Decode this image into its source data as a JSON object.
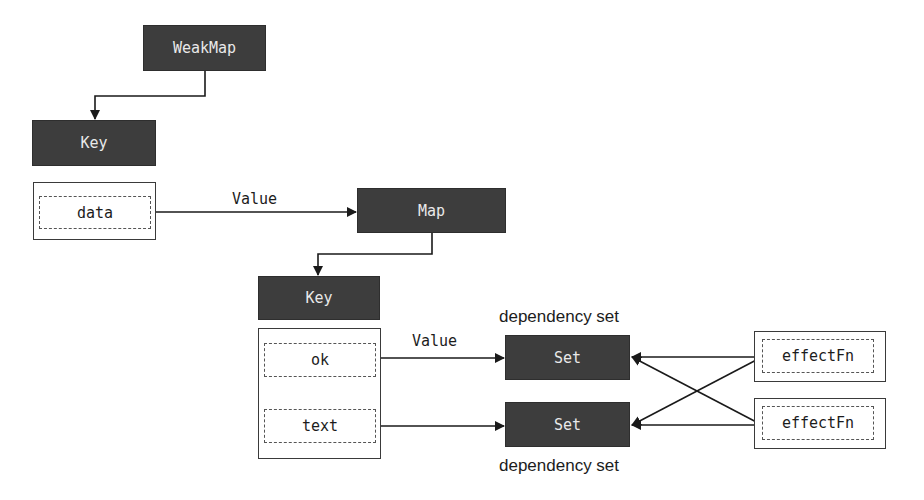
{
  "diagram": {
    "type": "reactive-dependency-structure",
    "colors": {
      "node_fill": "#3d3d3d",
      "node_text": "#e9e9e9",
      "line": "#1a1a1a",
      "background": "#ffffff"
    },
    "nodes": {
      "weakmap": {
        "label": "WeakMap"
      },
      "key_top": {
        "label": "Key"
      },
      "data": {
        "label": "data"
      },
      "map": {
        "label": "Map"
      },
      "key_bottom": {
        "label": "Key"
      },
      "ok": {
        "label": "ok"
      },
      "text": {
        "label": "text"
      },
      "set_top": {
        "label": "Set"
      },
      "set_bottom": {
        "label": "Set"
      },
      "effect_top": {
        "label": "effectFn"
      },
      "effect_bottom": {
        "label": "effectFn"
      }
    },
    "edge_labels": {
      "data_to_map": "Value",
      "ok_to_set": "Value"
    },
    "annotations": {
      "set_top_caption": "dependency set",
      "set_bottom_caption": "dependency set"
    },
    "edges": [
      {
        "from": "WeakMap",
        "to": "Key"
      },
      {
        "from": "data",
        "to": "Map",
        "label": "Value"
      },
      {
        "from": "Map",
        "to": "Key"
      },
      {
        "from": "ok",
        "to": "Set (top)",
        "label": "Value"
      },
      {
        "from": "text",
        "to": "Set (bottom)"
      },
      {
        "from": "effectFn (top)",
        "to": "Set (top)"
      },
      {
        "from": "effectFn (top)",
        "to": "Set (bottom)"
      },
      {
        "from": "effectFn (bottom)",
        "to": "Set (top)"
      },
      {
        "from": "effectFn (bottom)",
        "to": "Set (bottom)"
      }
    ]
  }
}
